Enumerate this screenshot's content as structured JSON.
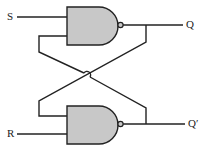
{
  "diagram": {
    "type": "SR latch (cross-coupled NAND gates)",
    "inputs": {
      "set": "S",
      "reset": "R"
    },
    "outputs": {
      "q": "Q",
      "q_bar": "Q′"
    },
    "gates": [
      {
        "name": "top-nand",
        "kind": "NAND",
        "inputs": [
          "S",
          "Q′"
        ],
        "output": "Q"
      },
      {
        "name": "bottom-nand",
        "kind": "NAND",
        "inputs": [
          "Q",
          "R"
        ],
        "output": "Q′"
      }
    ],
    "colors": {
      "gate_fill": "#c8c8c8",
      "stroke": "#222222",
      "background": "#ffffff"
    }
  }
}
